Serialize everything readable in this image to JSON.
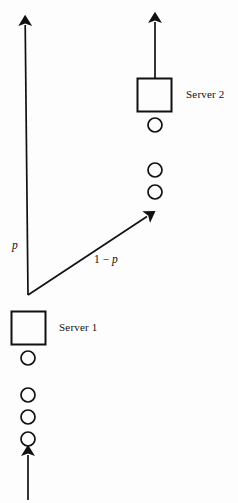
{
  "figure": {
    "type": "queueing-network-diagram",
    "width": 238,
    "height": 503,
    "background_color": "#fdfdfd",
    "stroke_color": "#111111"
  },
  "labels": {
    "server2": "Server 2",
    "server1": "Server 1",
    "branch_probability": "p",
    "branch_complement_prefix": "1 − ",
    "branch_complement_var": "p"
  },
  "nodes": {
    "server1": {
      "label": "Server 1",
      "shape": "square",
      "x": 11,
      "y": 311,
      "width": 35,
      "height": 34,
      "queue_circles": 4,
      "queue_circle_centers_y": [
        358,
        395,
        417,
        439
      ],
      "queue_circle_center_x": 28,
      "queue_circle_radius": 7
    },
    "server2": {
      "label": "Server 2",
      "shape": "square",
      "x": 137,
      "y": 78,
      "width": 35,
      "height": 34,
      "queue_circles": 3,
      "queue_circle_centers_y": [
        125,
        170,
        192
      ],
      "queue_circle_center_x": 155,
      "queue_circle_radius": 7
    }
  },
  "arrows": {
    "external_arrival": {
      "name": "external-arrival-arrow",
      "from": [
        28,
        500
      ],
      "to": [
        28,
        452
      ],
      "direction": "up"
    },
    "branch_p": {
      "name": "branch-p-arrow",
      "label": "p",
      "from": [
        28,
        295
      ],
      "to": [
        25,
        21
      ],
      "direction": "up"
    },
    "branch_one_minus_p": {
      "name": "branch-one-minus-p-arrow",
      "label": "1 − p",
      "from": [
        28,
        295
      ],
      "to": [
        151,
        214
      ],
      "direction": "up-right"
    },
    "server2_departure": {
      "name": "server2-departure-arrow",
      "from": [
        155,
        78
      ],
      "to": [
        155,
        18
      ],
      "direction": "up"
    }
  }
}
